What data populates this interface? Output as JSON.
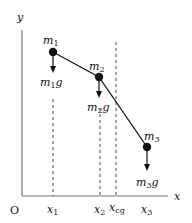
{
  "diagram": {
    "axes": {
      "x_label": "x",
      "y_label": "y",
      "origin_label": "O"
    },
    "masses": [
      {
        "name": "m",
        "sub": "1",
        "force_label": "m",
        "force_sub": "1",
        "force_suffix": "g"
      },
      {
        "name": "m",
        "sub": "2",
        "force_label": "m",
        "force_sub": "2",
        "force_suffix": "g"
      },
      {
        "name": "m",
        "sub": "3",
        "force_label": "m",
        "force_sub": "3",
        "force_suffix": "g"
      }
    ],
    "x_ticks": [
      {
        "base": "x",
        "sub": "1"
      },
      {
        "base": "x",
        "sub": "2"
      },
      {
        "base": "x",
        "sub": "cg"
      },
      {
        "base": "x",
        "sub": "3"
      }
    ],
    "colors": {
      "axis": "#777777",
      "line": "#111111",
      "dash": "#333333"
    }
  }
}
